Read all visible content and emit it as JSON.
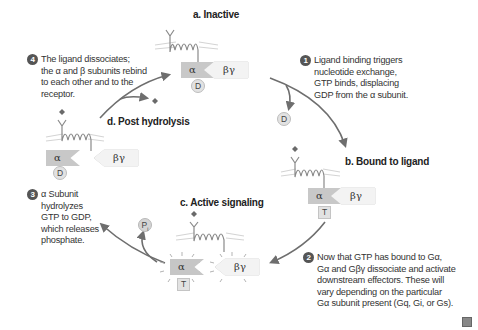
{
  "stages": {
    "a": "a. Inactive",
    "b": "b. Bound to ligand",
    "c": "c. Active signaling",
    "d": "d. Post hydrolysis"
  },
  "steps": [
    {
      "num": "1",
      "lines": [
        "Ligand binding triggers",
        "nucleotide exchange,",
        "GTP binds, displacing",
        "GDP from the α subunit."
      ]
    },
    {
      "num": "2",
      "lines": [
        "Now that GTP has bound to Gα,",
        "Gα and Gβγ dissociate and activate",
        "downstream effectors. These will",
        "vary depending on the particular",
        "Gα subunit present (Gq, Gi, or Gs)."
      ]
    },
    {
      "num": "3",
      "lines": [
        "α Subunit",
        "hydrolyzes",
        "GTP to GDP,",
        "which releases",
        "phosphate."
      ]
    },
    {
      "num": "4",
      "lines": [
        "The ligand dissociates;",
        "the α and β subunits rebind",
        "to each other and to the",
        "receptor."
      ]
    }
  ],
  "subunits": {
    "alpha": "α",
    "beta_gamma": "βγ",
    "gdp": "D",
    "gtp": "T",
    "phosphate": "P",
    "phosphate_sub": "i"
  },
  "colors": {
    "alpha_fill": "#c8c8c8",
    "beta_gamma_fill": "#f3f3f3",
    "arrow": "#6e6e6e",
    "ligand": "#6a6a6a",
    "membrane": "#cfcfcf"
  }
}
